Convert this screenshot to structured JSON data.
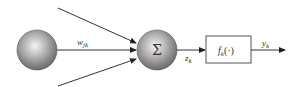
{
  "diagram": {
    "input_node": {
      "label": ""
    },
    "weight_label": {
      "main": "w",
      "sub": "jk"
    },
    "sum_node": {
      "label": "Σ"
    },
    "sum_output_label": {
      "main": "z",
      "sub": "k"
    },
    "activation_box": {
      "main": "f",
      "sub": "k",
      "suffix": "(·)"
    },
    "output_label": {
      "main": "y",
      "sub": "k"
    },
    "colors": {
      "line": "#333333",
      "node_light": "#f2f2f2",
      "node_dark": "#6e6e6e",
      "box_border": "#555555"
    }
  }
}
